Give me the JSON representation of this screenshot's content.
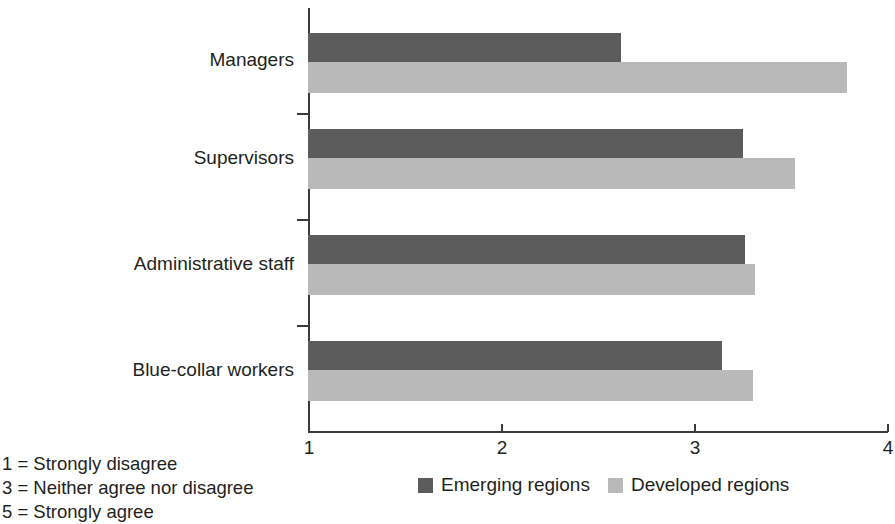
{
  "chart_data": {
    "type": "bar",
    "orientation": "horizontal",
    "title": "",
    "xlabel": "",
    "ylabel": "",
    "categories": [
      "Managers",
      "Supervisors",
      "Administrative staff",
      "Blue-collar workers"
    ],
    "series": [
      {
        "name": "Emerging regions",
        "color": "#5c5c5c",
        "values": [
          2.62,
          3.25,
          3.26,
          3.14
        ]
      },
      {
        "name": "Developed regions",
        "color": "#b9b9b9",
        "values": [
          3.79,
          3.52,
          3.31,
          3.3
        ]
      }
    ],
    "xlim": [
      1,
      4
    ],
    "xticks": [
      1,
      2,
      3,
      4
    ],
    "xtick_labels": [
      "1",
      "2",
      "3",
      "4"
    ],
    "grid": false,
    "legend_position": "bottom"
  },
  "scale_notes": [
    "1 = Strongly disagree",
    "3 = Neither agree nor disagree",
    "5 = Strongly agree"
  ],
  "legend": {
    "items": [
      {
        "label": "Emerging regions",
        "swatch": "emerging"
      },
      {
        "label": "Developed regions",
        "swatch": "developed"
      }
    ]
  }
}
